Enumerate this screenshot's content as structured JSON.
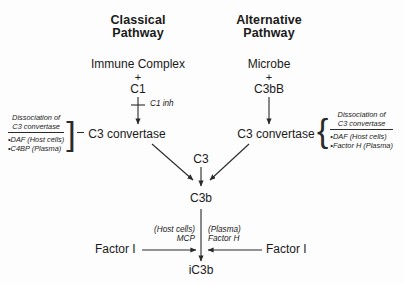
{
  "diagram": {
    "colors": {
      "ink": "#2a2a2a",
      "background": "#fdfdfd"
    }
  },
  "classical": {
    "header_line1": "Classical",
    "header_line2": "Pathway",
    "initiator": "Immune Complex",
    "plus": "+",
    "component": "C1",
    "inhibitor": "C1 inh",
    "convertase": "C3 convertase",
    "regulator_box": {
      "title_line1": "Dissociation of",
      "title_line2": "C3 convertase",
      "items": [
        "•DAF (Host cells)",
        "•C4BP (Plasma)"
      ],
      "bracket": "]"
    }
  },
  "alternative": {
    "header_line1": "Alternative",
    "header_line2": "Pathway",
    "initiator": "Microbe",
    "plus": "+",
    "component": "C3bB",
    "convertase": "C3 convertase",
    "regulator_box": {
      "title_line1": "Dissociation of",
      "title_line2": "C3 convertase",
      "items": [
        "•DAF (Host cells)",
        "•Factor H (Plasma)"
      ],
      "bracket": "{"
    }
  },
  "center": {
    "substrate": "C3",
    "product": "C3b",
    "final_product": "iC3b"
  },
  "cleavage": {
    "left_enzyme": "Factor I",
    "right_enzyme": "Factor I",
    "left_cofactor_source": "(Host cells)",
    "left_cofactor": "MCP",
    "right_cofactor_source": "(Plasma)",
    "right_cofactor": "Factor H"
  }
}
